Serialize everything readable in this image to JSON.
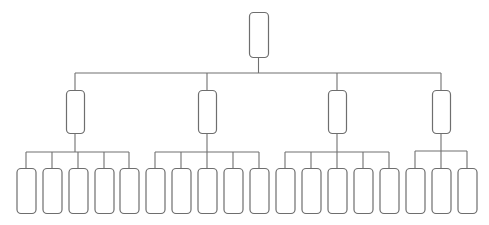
{
  "diagram": {
    "type": "org-chart",
    "colors": {
      "line": "#707070",
      "node_stroke": "#6e6e6e",
      "node_fill": "#ffffff",
      "background": "#ffffff"
    },
    "root": {
      "label": "",
      "x": 249,
      "y": 12,
      "w": 19,
      "h": 45
    },
    "root_bus_y": 73,
    "level1": [
      {
        "label": "",
        "cx": 75,
        "y": 90,
        "w": 18,
        "h": 43,
        "bus_y": 152,
        "children": [
          {
            "label": "",
            "cx": 26
          },
          {
            "label": "",
            "cx": 52
          },
          {
            "label": "",
            "cx": 78
          },
          {
            "label": "",
            "cx": 104
          },
          {
            "label": "",
            "cx": 129
          }
        ]
      },
      {
        "label": "",
        "cx": 207,
        "y": 90,
        "w": 18,
        "h": 43,
        "bus_y": 152,
        "children": [
          {
            "label": "",
            "cx": 155
          },
          {
            "label": "",
            "cx": 181
          },
          {
            "label": "",
            "cx": 207
          },
          {
            "label": "",
            "cx": 233
          },
          {
            "label": "",
            "cx": 259
          }
        ]
      },
      {
        "label": "",
        "cx": 337,
        "y": 90,
        "w": 18,
        "h": 43,
        "bus_y": 152,
        "children": [
          {
            "label": "",
            "cx": 285
          },
          {
            "label": "",
            "cx": 311
          },
          {
            "label": "",
            "cx": 337
          },
          {
            "label": "",
            "cx": 363
          },
          {
            "label": "",
            "cx": 389
          }
        ]
      },
      {
        "label": "",
        "cx": 441,
        "y": 90,
        "w": 18,
        "h": 43,
        "bus_y": 151,
        "children": [
          {
            "label": "",
            "cx": 415
          },
          {
            "label": "",
            "cx": 441
          },
          {
            "label": "",
            "cx": 467
          }
        ]
      }
    ],
    "leaf": {
      "y": 168,
      "w": 19,
      "h": 45
    }
  }
}
